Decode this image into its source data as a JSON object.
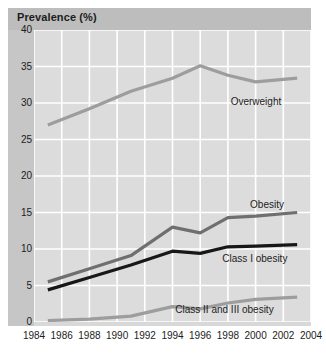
{
  "chart_data": {
    "type": "line",
    "title": "Prevalence (%)",
    "xlabel": "",
    "ylabel": "Prevalence (%)",
    "xlim": [
      1984,
      2004
    ],
    "ylim": [
      0,
      40
    ],
    "xticks": [
      1984,
      1986,
      1988,
      1990,
      1992,
      1994,
      1996,
      1998,
      2000,
      2002,
      2004
    ],
    "yticks": [
      0,
      5,
      10,
      15,
      20,
      25,
      30,
      35,
      40
    ],
    "grid": true,
    "legend_position": "inline-right",
    "x": [
      1985,
      1988,
      1991,
      1994,
      1996,
      1998,
      2000,
      2003
    ],
    "series": [
      {
        "name": "Overweight",
        "color": "#9d9d9d",
        "label_x": 1998.2,
        "label_y": 30.2,
        "values": [
          27.0,
          29.2,
          31.6,
          33.4,
          35.1,
          33.8,
          32.9,
          33.4
        ]
      },
      {
        "name": "Obesity",
        "color": "#6f6f6f",
        "label_x": 1999.6,
        "label_y": 16.0,
        "values": [
          5.5,
          7.3,
          9.1,
          13.0,
          12.2,
          14.3,
          14.5,
          15.0
        ]
      },
      {
        "name": "Class I obesity",
        "color": "#171717",
        "label_x": 1997.6,
        "label_y": 8.6,
        "values": [
          4.4,
          6.1,
          7.8,
          9.7,
          9.4,
          10.3,
          10.4,
          10.6
        ]
      },
      {
        "name": "Class II and III obesity",
        "color": "#9d9d9d",
        "label_x": 1994.2,
        "label_y": 1.6,
        "values": [
          0.2,
          0.4,
          0.8,
          2.1,
          1.8,
          2.6,
          3.1,
          3.4
        ]
      }
    ]
  }
}
